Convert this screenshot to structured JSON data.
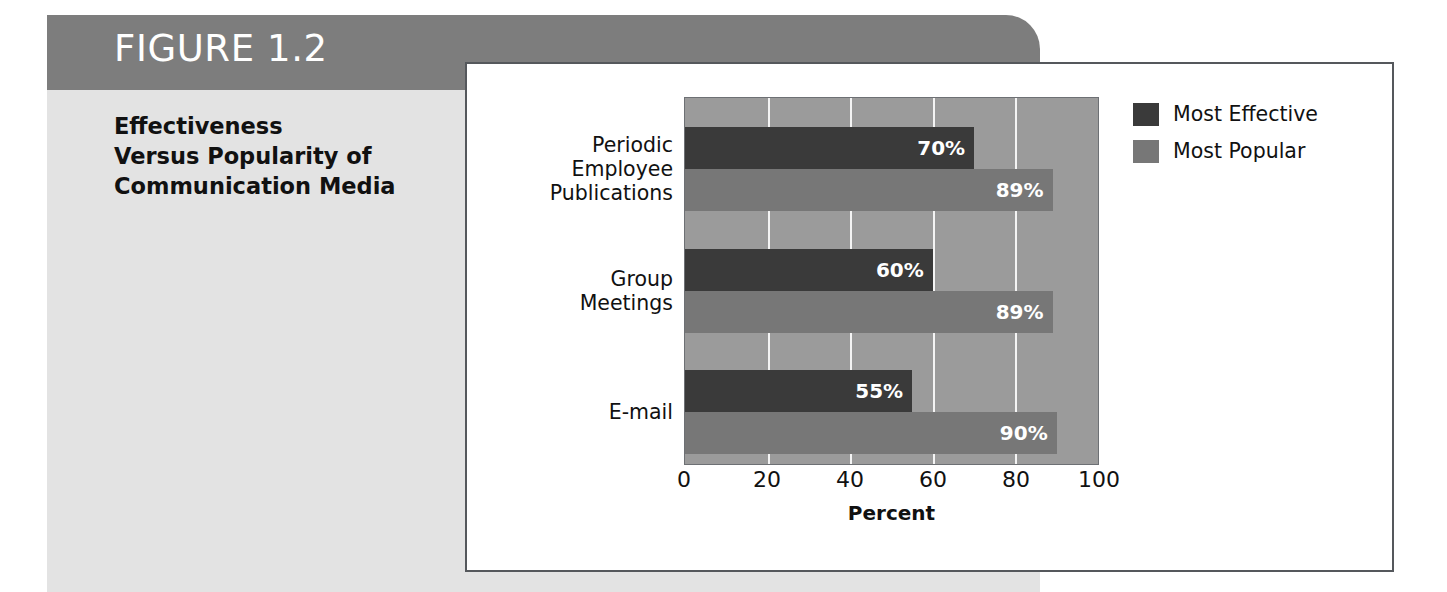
{
  "figure": {
    "banner_label": "FIGURE 1.2",
    "caption_lines": [
      "Effectiveness",
      "Versus Popularity of",
      "Communication Media"
    ],
    "banner_color": "#7d7d7d",
    "body_color": "#e3e3e3"
  },
  "chart_data": {
    "type": "bar",
    "orientation": "horizontal",
    "title": "",
    "subtitle": "",
    "xlabel": "Percent",
    "ylabel": "",
    "xlim": [
      0,
      100
    ],
    "xticks": [
      0,
      20,
      40,
      60,
      80,
      100
    ],
    "xtick_labels": [
      "0",
      "20",
      "40",
      "60",
      "80",
      "100"
    ],
    "grid": "vertical",
    "grid_color": "#f4f4f4",
    "plot_background": "#9b9b9b",
    "legend_position": "top-right-outside",
    "categories": [
      "Periodic Employee Publications",
      "Group Meetings",
      "E-mail"
    ],
    "category_label_lines": [
      [
        "Periodic",
        "Employee",
        "Publications"
      ],
      [
        "Group",
        "Meetings"
      ],
      [
        "E-mail"
      ]
    ],
    "series": [
      {
        "name": "Most Effective",
        "color": "#3a3a3a",
        "values": [
          70,
          60,
          55
        ],
        "value_labels": [
          "70%",
          "60%",
          "55%"
        ]
      },
      {
        "name": "Most Popular",
        "color": "#777777",
        "values": [
          89,
          89,
          90
        ],
        "value_labels": [
          "89%",
          "89%",
          "90%"
        ]
      }
    ]
  }
}
